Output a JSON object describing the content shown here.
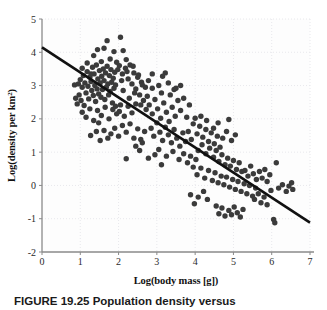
{
  "figure": {
    "caption_label": "FIGURE 19.25",
    "caption_text": "Population density versus",
    "caption_full": "FIGURE 19.25 Population density versus"
  },
  "colors": {
    "point": "#3b3b3b",
    "line": "#111111",
    "axis": "#8a8a8a",
    "grid": "#e8e8ec",
    "background": "#fdfdfd",
    "text": "#1a1a1a"
  },
  "chart_data": {
    "type": "scatter",
    "title": "",
    "xlabel": "Log(body mass [g])",
    "ylabel_parts": {
      "before": "Log(density per km",
      "sup": "2",
      "after": ")"
    },
    "ylabel": "Log(density per km2)",
    "xlim": [
      0,
      7
    ],
    "ylim": [
      -2,
      5
    ],
    "xticks": [
      0,
      1,
      2,
      3,
      4,
      5,
      6,
      7
    ],
    "yticks": [
      -2,
      -1,
      0,
      1,
      2,
      3,
      4,
      5
    ],
    "xtick_labels": [
      "0",
      "1",
      "2",
      "3",
      "4",
      "5",
      "6",
      "7"
    ],
    "ytick_labels": [
      "-2",
      "-1",
      "0",
      "1",
      "2",
      "3",
      "4",
      "5"
    ],
    "grid": true,
    "grid_style": "dotted",
    "legend": null,
    "point_size": 5.4,
    "trendline": {
      "label": "regression line",
      "x": [
        0,
        7
      ],
      "y": [
        4.15,
        -1.12
      ],
      "slope": -0.7529,
      "intercept": 4.15,
      "width": 2.6
    },
    "points": [
      [
        0.85,
        3.02
      ],
      [
        0.88,
        2.62
      ],
      [
        0.92,
        2.45
      ],
      [
        0.95,
        3.05
      ],
      [
        0.97,
        2.72
      ],
      [
        1.0,
        3.18
      ],
      [
        1.02,
        2.55
      ],
      [
        1.05,
        2.95
      ],
      [
        1.08,
        3.3
      ],
      [
        1.1,
        2.4
      ],
      [
        1.12,
        3.08
      ],
      [
        1.15,
        2.78
      ],
      [
        1.18,
        3.42
      ],
      [
        1.2,
        2.98
      ],
      [
        1.22,
        2.6
      ],
      [
        1.25,
        3.25
      ],
      [
        1.27,
        1.5
      ],
      [
        1.28,
        3.12
      ],
      [
        1.3,
        2.85
      ],
      [
        1.32,
        3.55
      ],
      [
        1.34,
        2.7
      ],
      [
        1.36,
        3.35
      ],
      [
        1.38,
        3.0
      ],
      [
        1.4,
        2.52
      ],
      [
        1.42,
        3.62
      ],
      [
        1.44,
        2.9
      ],
      [
        1.46,
        3.2
      ],
      [
        1.48,
        2.75
      ],
      [
        1.5,
        3.45
      ],
      [
        1.52,
        3.08
      ],
      [
        1.54,
        2.65
      ],
      [
        1.56,
        3.28
      ],
      [
        1.58,
        2.88
      ],
      [
        1.6,
        3.5
      ],
      [
        1.62,
        3.15
      ],
      [
        1.64,
        2.58
      ],
      [
        1.66,
        3.38
      ],
      [
        1.68,
        2.95
      ],
      [
        1.7,
        3.58
      ],
      [
        1.72,
        3.05
      ],
      [
        1.74,
        2.72
      ],
      [
        1.76,
        3.3
      ],
      [
        1.78,
        2.82
      ],
      [
        1.8,
        3.48
      ],
      [
        1.82,
        3.1
      ],
      [
        1.84,
        2.48
      ],
      [
        1.86,
        3.22
      ],
      [
        1.88,
        2.92
      ],
      [
        1.9,
        3.4
      ],
      [
        1.92,
        3.02
      ],
      [
        1.35,
        3.9
      ],
      [
        1.45,
        4.08
      ],
      [
        1.55,
        3.72
      ],
      [
        1.62,
        4.12
      ],
      [
        1.7,
        4.35
      ],
      [
        1.78,
        3.8
      ],
      [
        1.88,
        4.02
      ],
      [
        1.95,
        3.7
      ],
      [
        2.05,
        4.45
      ],
      [
        2.12,
        4.05
      ],
      [
        2.2,
        3.78
      ],
      [
        2.02,
        3.6
      ],
      [
        2.1,
        3.35
      ],
      [
        2.18,
        3.52
      ],
      [
        2.25,
        3.2
      ],
      [
        2.3,
        3.62
      ],
      [
        2.35,
        3.05
      ],
      [
        2.4,
        3.38
      ],
      [
        2.45,
        2.9
      ],
      [
        2.5,
        3.25
      ],
      [
        2.55,
        2.72
      ],
      [
        2.6,
        3.1
      ],
      [
        2.65,
        2.55
      ],
      [
        2.7,
        2.95
      ],
      [
        2.75,
        2.68
      ],
      [
        1.05,
        2.2
      ],
      [
        1.15,
        2.05
      ],
      [
        1.25,
        2.3
      ],
      [
        1.35,
        1.95
      ],
      [
        1.45,
        2.25
      ],
      [
        1.55,
        2.1
      ],
      [
        1.65,
        2.35
      ],
      [
        1.75,
        2.0
      ],
      [
        1.85,
        2.28
      ],
      [
        1.95,
        2.15
      ],
      [
        2.05,
        2.42
      ],
      [
        2.15,
        2.08
      ],
      [
        2.25,
        2.38
      ],
      [
        2.35,
        2.18
      ],
      [
        2.45,
        2.45
      ],
      [
        1.8,
        1.55
      ],
      [
        1.9,
        1.72
      ],
      [
        2.0,
        1.48
      ],
      [
        2.1,
        1.8
      ],
      [
        2.2,
        1.6
      ],
      [
        2.3,
        1.85
      ],
      [
        2.4,
        1.42
      ],
      [
        2.5,
        1.7
      ],
      [
        2.58,
        1.38
      ],
      [
        2.68,
        1.62
      ],
      [
        2.2,
        0.8
      ],
      [
        2.45,
        1.18
      ],
      [
        2.55,
        1.05
      ],
      [
        2.62,
        1.28
      ],
      [
        2.8,
        2.42
      ],
      [
        2.88,
        2.15
      ],
      [
        2.95,
        2.58
      ],
      [
        3.02,
        2.3
      ],
      [
        3.1,
        2.02
      ],
      [
        3.18,
        2.48
      ],
      [
        3.25,
        2.2
      ],
      [
        3.32,
        1.92
      ],
      [
        3.4,
        2.35
      ],
      [
        3.48,
        2.08
      ],
      [
        3.05,
        3.0
      ],
      [
        3.12,
        2.78
      ],
      [
        3.22,
        3.38
      ],
      [
        3.35,
        2.72
      ],
      [
        3.45,
        2.88
      ],
      [
        3.55,
        2.55
      ],
      [
        3.62,
        2.25
      ],
      [
        3.7,
        2.62
      ],
      [
        3.78,
        2.05
      ],
      [
        3.85,
        2.42
      ],
      [
        2.85,
        1.72
      ],
      [
        2.92,
        1.48
      ],
      [
        3.0,
        1.88
      ],
      [
        3.08,
        1.6
      ],
      [
        3.15,
        1.35
      ],
      [
        3.22,
        1.75
      ],
      [
        3.3,
        1.52
      ],
      [
        3.38,
        1.28
      ],
      [
        3.45,
        1.68
      ],
      [
        3.52,
        1.42
      ],
      [
        3.6,
        1.18
      ],
      [
        3.68,
        1.58
      ],
      [
        3.75,
        1.32
      ],
      [
        3.82,
        1.62
      ],
      [
        3.9,
        1.38
      ],
      [
        2.95,
        0.92
      ],
      [
        3.05,
        1.08
      ],
      [
        3.25,
        0.88
      ],
      [
        3.42,
        1.02
      ],
      [
        3.58,
        0.78
      ],
      [
        3.7,
        0.95
      ],
      [
        3.8,
        0.68
      ],
      [
        3.88,
        0.88
      ],
      [
        3.95,
        0.55
      ],
      [
        4.02,
        0.78
      ],
      [
        3.95,
        1.85
      ],
      [
        4.05,
        1.55
      ],
      [
        4.12,
        1.78
      ],
      [
        4.2,
        1.45
      ],
      [
        4.28,
        1.68
      ],
      [
        4.35,
        1.32
      ],
      [
        4.42,
        1.58
      ],
      [
        4.5,
        1.25
      ],
      [
        4.58,
        1.48
      ],
      [
        4.65,
        1.15
      ],
      [
        4.0,
        2.02
      ],
      [
        4.15,
        2.08
      ],
      [
        4.3,
        1.95
      ],
      [
        4.48,
        1.72
      ],
      [
        4.6,
        1.88
      ],
      [
        4.72,
        1.42
      ],
      [
        4.82,
        1.62
      ],
      [
        4.88,
        1.98
      ],
      [
        4.95,
        1.35
      ],
      [
        5.05,
        1.52
      ],
      [
        4.08,
        1.05
      ],
      [
        4.18,
        1.22
      ],
      [
        4.28,
        0.95
      ],
      [
        4.38,
        1.12
      ],
      [
        4.48,
        0.85
      ],
      [
        4.55,
        1.05
      ],
      [
        4.62,
        0.72
      ],
      [
        4.7,
        0.92
      ],
      [
        4.78,
        0.62
      ],
      [
        4.85,
        0.82
      ],
      [
        4.92,
        0.58
      ],
      [
        5.0,
        0.75
      ],
      [
        5.08,
        0.48
      ],
      [
        5.15,
        0.68
      ],
      [
        5.22,
        0.42
      ],
      [
        4.05,
        0.32
      ],
      [
        4.15,
        0.52
      ],
      [
        4.25,
        0.22
      ],
      [
        4.35,
        0.45
      ],
      [
        4.45,
        0.15
      ],
      [
        4.52,
        0.38
      ],
      [
        4.6,
        0.08
      ],
      [
        4.68,
        0.28
      ],
      [
        4.75,
        0.02
      ],
      [
        4.82,
        0.25
      ],
      [
        4.9,
        -0.05
      ],
      [
        4.98,
        0.18
      ],
      [
        5.05,
        -0.12
      ],
      [
        5.12,
        0.12
      ],
      [
        5.2,
        -0.18
      ],
      [
        5.28,
        0.05
      ],
      [
        5.35,
        -0.25
      ],
      [
        5.42,
        0.0
      ],
      [
        5.5,
        -0.32
      ],
      [
        5.58,
        -0.08
      ],
      [
        3.88,
        -0.28
      ],
      [
        3.98,
        -0.55
      ],
      [
        4.08,
        -0.35
      ],
      [
        4.22,
        -0.18
      ],
      [
        4.32,
        -0.42
      ],
      [
        4.55,
        -0.62
      ],
      [
        4.62,
        -0.85
      ],
      [
        4.7,
        -0.68
      ],
      [
        4.78,
        -0.92
      ],
      [
        4.88,
        -0.75
      ],
      [
        4.95,
        -0.88
      ],
      [
        5.02,
        -0.65
      ],
      [
        5.1,
        -0.82
      ],
      [
        5.18,
        -0.95
      ],
      [
        5.25,
        -0.72
      ],
      [
        5.3,
        0.45
      ],
      [
        5.38,
        0.28
      ],
      [
        5.45,
        0.58
      ],
      [
        5.52,
        0.35
      ],
      [
        5.6,
        0.18
      ],
      [
        5.68,
        0.42
      ],
      [
        5.75,
        0.22
      ],
      [
        5.82,
        0.48
      ],
      [
        5.88,
        0.12
      ],
      [
        5.95,
        0.32
      ],
      [
        5.55,
        -0.42
      ],
      [
        5.65,
        -0.25
      ],
      [
        5.72,
        -0.52
      ],
      [
        5.8,
        -0.35
      ],
      [
        5.88,
        -0.58
      ],
      [
        5.98,
        -0.15
      ],
      [
        6.05,
        -1.02
      ],
      [
        6.08,
        -1.12
      ],
      [
        6.12,
        0.68
      ],
      [
        6.18,
        -0.08
      ],
      [
        6.28,
        0.02
      ],
      [
        6.38,
        -0.18
      ],
      [
        6.45,
        -0.02
      ],
      [
        6.52,
        0.08
      ],
      [
        6.55,
        -0.12
      ],
      [
        2.12,
        2.85
      ],
      [
        2.28,
        2.62
      ],
      [
        2.42,
        2.78
      ],
      [
        2.58,
        2.42
      ],
      [
        2.72,
        2.28
      ],
      [
        1.98,
        3.48
      ],
      [
        2.08,
        3.15
      ],
      [
        2.22,
        3.42
      ],
      [
        2.38,
        3.58
      ],
      [
        2.52,
        3.32
      ],
      [
        2.62,
        3.02
      ],
      [
        2.78,
        3.15
      ],
      [
        2.88,
        3.35
      ],
      [
        3.15,
        3.28
      ],
      [
        3.3,
        3.08
      ],
      [
        1.05,
        3.52
      ],
      [
        1.18,
        3.68
      ],
      [
        1.28,
        3.35
      ],
      [
        1.92,
        2.38
      ],
      [
        2.02,
        2.22
      ],
      [
        1.48,
        1.88
      ],
      [
        1.62,
        1.65
      ],
      [
        1.72,
        1.42
      ],
      [
        1.42,
        1.62
      ],
      [
        1.52,
        1.35
      ],
      [
        2.88,
        2.92
      ],
      [
        3.5,
        2.92
      ],
      [
        3.62,
        3.0
      ],
      [
        2.78,
        0.82
      ],
      [
        3.12,
        0.62
      ]
    ]
  }
}
